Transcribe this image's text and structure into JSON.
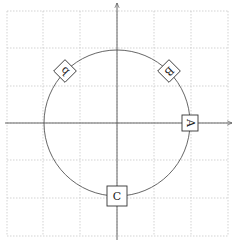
{
  "diagram": {
    "type": "unit-circle-with-rotated-node-labels",
    "canvas": {
      "width": 235,
      "height": 247
    },
    "origin": {
      "x": 117,
      "y": 123
    },
    "circle": {
      "cx": 117,
      "cy": 123,
      "r": 73,
      "stroke": "#555555"
    },
    "grid": {
      "color": "#c8c8c8",
      "style": "dotted",
      "vertical_x": [
        7,
        43,
        80,
        117,
        154,
        191,
        228
      ],
      "horizontal_y": [
        11,
        48,
        86,
        123,
        160,
        198,
        236
      ],
      "x_range": [
        7,
        228
      ],
      "y_range": [
        11,
        236
      ]
    },
    "axes": {
      "x": {
        "x1": 5,
        "y": 123,
        "x2": 232,
        "arrow": true
      },
      "y": {
        "x": 117,
        "y1": 240,
        "y2": 3,
        "arrow": true
      }
    },
    "nodes": [
      {
        "label": "A",
        "angle_deg": 0,
        "x": 190,
        "y": 123,
        "rotation": 90,
        "size": 16
      },
      {
        "label": "B",
        "angle_deg": 45,
        "x": 169,
        "y": 71,
        "rotation": 135,
        "size": 16
      },
      {
        "label": "b",
        "angle_deg": 135,
        "x": 65,
        "y": 71,
        "rotation": 225,
        "size": 16
      },
      {
        "label": "C",
        "angle_deg": 270,
        "x": 117,
        "y": 196,
        "rotation": 0,
        "size": 20
      }
    ]
  }
}
